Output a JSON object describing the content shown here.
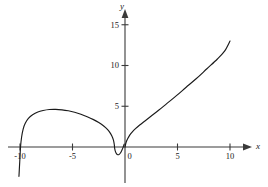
{
  "chart_data": {
    "type": "line",
    "title": "",
    "subtitle": "",
    "xlabel": "x",
    "ylabel": "y",
    "xlim": [
      -11.5,
      11.0
    ],
    "ylim": [
      -5.0,
      16.5
    ],
    "grid": false,
    "legend": null,
    "axis_style": "arrows-on-positive-ends",
    "xticks": [
      -10,
      -5,
      0,
      5,
      10
    ],
    "xticklabels": [
      "-10",
      "-5",
      "0",
      "5",
      "10"
    ],
    "yticks": [
      5,
      10,
      15
    ],
    "yticklabels": [
      "5",
      "10",
      "15"
    ],
    "series": [
      {
        "name": "left-branch",
        "comment": "rises steeply from below axis near x=-10, arches to peak ~4.6 near x=-6.4, descends to a small dip below axis between x=-1 and x=0",
        "points": [
          [
            -10.1,
            -3.6
          ],
          [
            -10.05,
            -2.4
          ],
          [
            -10.0,
            -1.2
          ],
          [
            -9.95,
            0.0
          ],
          [
            -9.85,
            1.2
          ],
          [
            -9.7,
            2.2
          ],
          [
            -9.5,
            2.9
          ],
          [
            -9.2,
            3.5
          ],
          [
            -8.8,
            3.95
          ],
          [
            -8.3,
            4.3
          ],
          [
            -7.8,
            4.48
          ],
          [
            -7.2,
            4.6
          ],
          [
            -6.6,
            4.62
          ],
          [
            -6.0,
            4.56
          ],
          [
            -5.4,
            4.44
          ],
          [
            -4.8,
            4.26
          ],
          [
            -4.2,
            4.02
          ],
          [
            -3.6,
            3.72
          ],
          [
            -3.0,
            3.36
          ],
          [
            -2.5,
            3.0
          ],
          [
            -2.0,
            2.55
          ],
          [
            -1.7,
            2.2
          ],
          [
            -1.45,
            1.8
          ],
          [
            -1.25,
            1.35
          ],
          [
            -1.1,
            0.85
          ],
          [
            -1.02,
            0.3
          ],
          [
            -0.98,
            -0.2
          ],
          [
            -0.9,
            -0.6
          ],
          [
            -0.8,
            -0.85
          ],
          [
            -0.68,
            -0.95
          ],
          [
            -0.55,
            -0.9
          ],
          [
            -0.42,
            -0.7
          ],
          [
            -0.3,
            -0.4
          ],
          [
            -0.18,
            -0.05
          ],
          [
            -0.08,
            0.35
          ]
        ]
      },
      {
        "name": "right-branch",
        "comment": "rises from origin with steep concave start then nearly linear, ending about y=13 at x=10",
        "points": [
          [
            0.0,
            0.0
          ],
          [
            0.1,
            0.55
          ],
          [
            0.25,
            1.0
          ],
          [
            0.45,
            1.45
          ],
          [
            0.7,
            1.85
          ],
          [
            1.0,
            2.25
          ],
          [
            1.4,
            2.7
          ],
          [
            1.9,
            3.2
          ],
          [
            2.5,
            3.8
          ],
          [
            3.2,
            4.5
          ],
          [
            4.0,
            5.35
          ],
          [
            4.9,
            6.3
          ],
          [
            5.8,
            7.3
          ],
          [
            6.8,
            8.4
          ],
          [
            7.8,
            9.6
          ],
          [
            8.8,
            10.8
          ],
          [
            9.5,
            11.8
          ],
          [
            10.0,
            13.0
          ]
        ]
      }
    ],
    "curve_color": "#1a1a1a",
    "axis_color": "#3a3a3a"
  },
  "axes": {
    "x_axis_name": "x",
    "y_axis_name": "y"
  },
  "labels": {
    "x": [
      "-10",
      "-5",
      "0",
      "5",
      "10"
    ],
    "y": [
      "15",
      "10",
      "5"
    ]
  }
}
